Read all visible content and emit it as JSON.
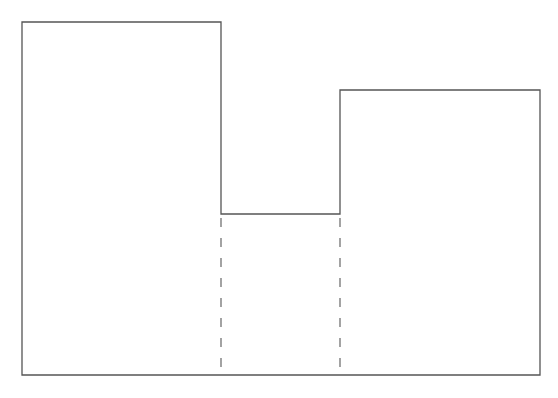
{
  "diagram": {
    "stroke_color": "#555555",
    "dash_color": "#666666",
    "baseline_y": 375,
    "blocks": [
      {
        "name": "left-block",
        "x0": 22,
        "x1": 221,
        "top": 22
      },
      {
        "name": "middle-block",
        "x0": 221,
        "x1": 340,
        "top": 214
      },
      {
        "name": "right-block",
        "x0": 340,
        "x1": 540,
        "top": 90
      }
    ],
    "dashed_lines": [
      {
        "x": 221,
        "y0": 214,
        "y1": 375
      },
      {
        "x": 340,
        "y0": 214,
        "y1": 375
      }
    ]
  }
}
